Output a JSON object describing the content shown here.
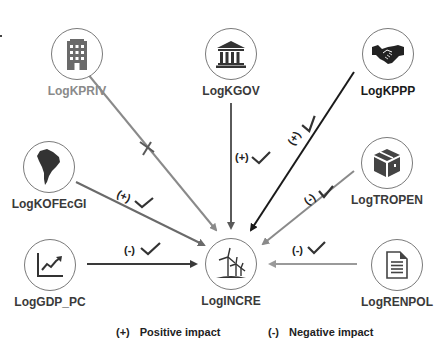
{
  "diagram": {
    "target": {
      "label": "LogINCRE",
      "icon": "wind-turbine-icon"
    },
    "sources": [
      {
        "id": "kpriv",
        "label": "LogKPRIV",
        "icon": "building-icon",
        "effect": "none",
        "annotation": "",
        "line_color": "#8a8a8a",
        "significant": false
      },
      {
        "id": "kgov",
        "label": "LogKGOV",
        "icon": "government-building-icon",
        "effect": "positive",
        "annotation": "(+)",
        "line_color": "#5a5a5a",
        "significant": true
      },
      {
        "id": "kppp",
        "label": "LogKPPP",
        "icon": "handshake-icon",
        "effect": "positive",
        "annotation": "(+)",
        "line_color": "#1a1a1a",
        "significant": true
      },
      {
        "id": "kofecgi",
        "label": "LogKOFEcGI",
        "icon": "south-america-map-icon",
        "effect": "positive",
        "annotation": "(+)",
        "line_color": "#6a6a6a",
        "significant": true
      },
      {
        "id": "tropen",
        "label": "LogTROPEN",
        "icon": "box-icon",
        "effect": "negative",
        "annotation": "(-)",
        "line_color": "#8a8a8a",
        "significant": true
      },
      {
        "id": "gdp",
        "label": "LogGDP_PC",
        "icon": "growth-chart-icon",
        "effect": "negative",
        "annotation": "(-)",
        "line_color": "#3a3a3a",
        "significant": true
      },
      {
        "id": "renpol",
        "label": "LogRENPOL",
        "icon": "document-icon",
        "effect": "negative",
        "annotation": "(-)",
        "line_color": "#9a9a9a",
        "significant": true
      }
    ],
    "legend": {
      "positive_symbol": "(+)",
      "positive_text": "Positive impact",
      "negative_symbol": "(-)",
      "negative_text": "Negative impact"
    },
    "colors": {
      "circle_border": "#7a7a7a",
      "icon_fill": "#555555",
      "check_color": "#333333"
    }
  }
}
